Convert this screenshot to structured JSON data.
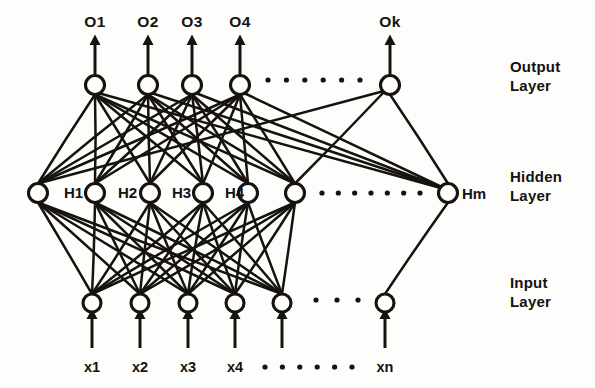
{
  "figure": {
    "ink_color": "#15120f",
    "background_color": "#fdfdfb"
  },
  "layers": {
    "output": {
      "name": "Output Layer",
      "label_line1": "Output",
      "label_line2": "Layer",
      "y": 85,
      "node_radius": 9.5,
      "visible_nodes": [
        {
          "id": "o1",
          "x": 95,
          "label": "O1",
          "label_x": 95,
          "label_y": 27
        },
        {
          "id": "o2",
          "x": 148,
          "label": "O2",
          "label_x": 148,
          "label_y": 27
        },
        {
          "id": "o3",
          "x": 192,
          "label": "O3",
          "label_x": 192,
          "label_y": 27
        },
        {
          "id": "o4",
          "x": 240,
          "label": "O4",
          "label_x": 240,
          "label_y": 27
        },
        {
          "id": "ok",
          "x": 390,
          "label": "Ok",
          "label_x": 390,
          "label_y": 27
        }
      ],
      "ellipsis": {
        "count": 6,
        "x_start": 268,
        "x_end": 360,
        "y": 80,
        "radius": 2.6
      }
    },
    "hidden": {
      "name": "Hidden Layer",
      "label_line1": "Hidden",
      "label_line2": "Layer",
      "y": 193,
      "node_radius": 9.5,
      "visible_nodes": [
        {
          "id": "h0",
          "x": 38,
          "label": "",
          "label_x": 0,
          "label_y": 0
        },
        {
          "id": "h1",
          "x": 95,
          "label": "H1",
          "label_x": 64,
          "label_y": 198
        },
        {
          "id": "h2",
          "x": 150,
          "label": "H2",
          "label_x": 118,
          "label_y": 198
        },
        {
          "id": "h3",
          "x": 203,
          "label": "H3",
          "label_x": 172,
          "label_y": 198
        },
        {
          "id": "h4",
          "x": 248,
          "label": "H4",
          "label_x": 225,
          "label_y": 198
        },
        {
          "id": "h5",
          "x": 295,
          "label": "",
          "label_x": 0,
          "label_y": 0
        },
        {
          "id": "hm",
          "x": 448,
          "label": "Hm",
          "label_x": 462,
          "label_y": 199
        }
      ],
      "ellipsis": {
        "count": 7,
        "x_start": 322,
        "x_end": 420,
        "y": 193,
        "radius": 2.6
      }
    },
    "input": {
      "name": "Input Layer",
      "label_line1": "Input",
      "label_line2": "Layer",
      "y": 303,
      "node_radius": 9.0,
      "visible_nodes": [
        {
          "id": "x1",
          "x": 92,
          "label": "x1",
          "label_x": 92,
          "label_y": 372
        },
        {
          "id": "x2",
          "x": 140,
          "label": "x2",
          "label_x": 140,
          "label_y": 372
        },
        {
          "id": "x3",
          "x": 188,
          "label": "x3",
          "label_x": 188,
          "label_y": 372
        },
        {
          "id": "x4",
          "x": 235,
          "label": "x4",
          "label_x": 235,
          "label_y": 372
        },
        {
          "id": "x5",
          "x": 282,
          "label": "",
          "label_x": 0,
          "label_y": 0
        },
        {
          "id": "xn",
          "x": 385,
          "label": "xn",
          "label_x": 385,
          "label_y": 372
        }
      ],
      "ellipsis": {
        "count": 3,
        "x_start": 316,
        "x_end": 358,
        "y": 300,
        "radius": 2.6
      },
      "bottom_ellipsis": {
        "count": 6,
        "x_start": 265,
        "x_end": 352,
        "y": 367,
        "radius": 2.6
      }
    }
  },
  "layer_labels": [
    {
      "id": "output-layer-label",
      "line1": "Output",
      "line2": "Layer",
      "x": 510,
      "y": 72
    },
    {
      "id": "hidden-layer-label",
      "line1": "Hidden",
      "line2": "Layer",
      "x": 510,
      "y": 182
    },
    {
      "id": "input-layer-label",
      "line1": "Input",
      "line2": "Layer",
      "x": 510,
      "y": 288
    }
  ],
  "arrows": {
    "output_up": {
      "from_y": 75,
      "to_y": 40,
      "head_size": 5.5
    },
    "input_up": {
      "from_y": 348,
      "to_y": 314,
      "head_size": 5.5
    }
  },
  "connections": {
    "input_to_hidden": "fully-connected",
    "hidden_to_output": "fully-connected"
  }
}
